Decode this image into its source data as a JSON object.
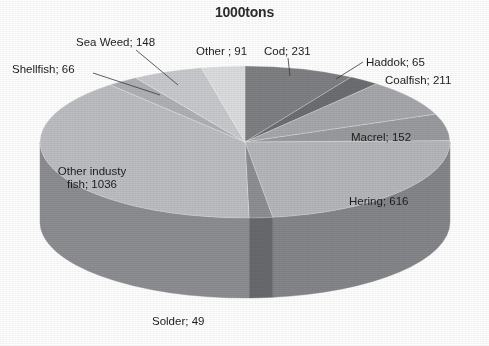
{
  "chart_data": {
    "type": "pie",
    "title": "1000tons",
    "unit": "1000tons",
    "labels": [
      "Cod",
      "Haddok",
      "Coalfish",
      "Macrel",
      "Hering",
      "Solder",
      "Other industy fish",
      "Shellfish",
      "Sea Weed",
      "Other "
    ],
    "values": [
      231,
      65,
      211,
      152,
      616,
      49,
      1036,
      66,
      148,
      91
    ],
    "total": 2665,
    "label_format": "name; value",
    "legend": "none",
    "grid": false,
    "three_d": true,
    "start_angle_deg": 0,
    "direction": "clockwise",
    "slices": [
      {
        "name": "Cod",
        "value": 231,
        "text": "Cod; 231",
        "color": "#7f8083",
        "side_color": "#5b5c5f",
        "leader": true
      },
      {
        "name": "Haddok",
        "value": 65,
        "text": "Haddok; 65",
        "color": "#6d6e71",
        "side_color": "#4d4e50",
        "leader": true
      },
      {
        "name": "Coalfish",
        "value": 211,
        "text": "Coalfish; 211",
        "color": "#a7a8ab",
        "side_color": "#7b7c7f",
        "leader": false
      },
      {
        "name": "Macrel",
        "value": 152,
        "text": "Macrel; 152",
        "color": "#9a9b9e",
        "side_color": "#717275",
        "leader": false
      },
      {
        "name": "Hering",
        "value": 616,
        "text": "Hering; 616",
        "color": "#b6b7ba",
        "side_color": "#85868a",
        "leader": false
      },
      {
        "name": "Solder",
        "value": 49,
        "text": "Solder; 49",
        "color": "#8e8f92",
        "side_color": "#696a6d",
        "leader": false
      },
      {
        "name": "Other industy fish",
        "value": 1036,
        "text": "Other industy\nfish; 1036",
        "color": "#bdbec1",
        "side_color": "#8d8e91",
        "leader": false
      },
      {
        "name": "Shellfish",
        "value": 66,
        "text": "Shellfish; 66",
        "color": "#b0b1b4",
        "side_color": "#828386",
        "leader": true
      },
      {
        "name": "Sea Weed",
        "value": 148,
        "text": "Sea Weed; 148",
        "color": "#c9cacd",
        "side_color": "#97989b",
        "leader": true
      },
      {
        "name": "Other ",
        "value": 91,
        "text": "Other ; 91",
        "color": "#dcdddf",
        "side_color": "#a6a7aa",
        "leader": false
      }
    ]
  },
  "labels": {
    "cod": "Cod; 231",
    "haddok": "Haddok; 65",
    "coalfish": "Coalfish; 211",
    "macrel": "Macrel; 152",
    "hering": "Hering; 616",
    "solder": "Solder; 49",
    "other_industy_fish_line1": "Other industy",
    "other_industy_fish_line2": "fish; 1036",
    "shellfish": "Shellfish; 66",
    "sea_weed": "Sea Weed; 148",
    "other": "Other ; 91"
  }
}
